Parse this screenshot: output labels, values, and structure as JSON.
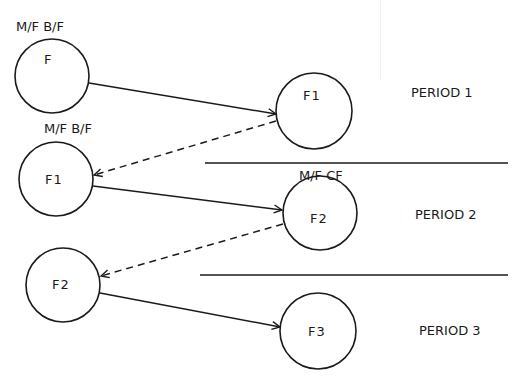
{
  "diagram": {
    "nodes": [
      {
        "id": "F",
        "label": "F",
        "annotation": "M/F B/F",
        "period": 1,
        "column": "left"
      },
      {
        "id": "F1_r",
        "label": "F1",
        "annotation": "",
        "period": 1,
        "column": "right"
      },
      {
        "id": "F1_l",
        "label": "F1",
        "annotation": "M/F B/F",
        "period": 2,
        "column": "left"
      },
      {
        "id": "F2_r",
        "label": "F2",
        "annotation": "M/F CF",
        "period": 2,
        "column": "right"
      },
      {
        "id": "F2_l",
        "label": "F2",
        "annotation": "",
        "period": 3,
        "column": "left"
      },
      {
        "id": "F3",
        "label": "F3",
        "annotation": "",
        "period": 3,
        "column": "right"
      }
    ],
    "edges": [
      {
        "from": "F",
        "to": "F1_r",
        "style": "solid"
      },
      {
        "from": "F1_r",
        "to": "F1_l",
        "style": "dashed"
      },
      {
        "from": "F1_l",
        "to": "F2_r",
        "style": "solid"
      },
      {
        "from": "F2_r",
        "to": "F2_l",
        "style": "dashed"
      },
      {
        "from": "F2_l",
        "to": "F3",
        "style": "solid"
      }
    ],
    "periods": [
      {
        "label": "PERIOD 1"
      },
      {
        "label": "PERIOD 2"
      },
      {
        "label": "PERIOD 3"
      }
    ],
    "colors": {
      "ink": "#1a1a1a",
      "background": "#ffffff"
    }
  }
}
